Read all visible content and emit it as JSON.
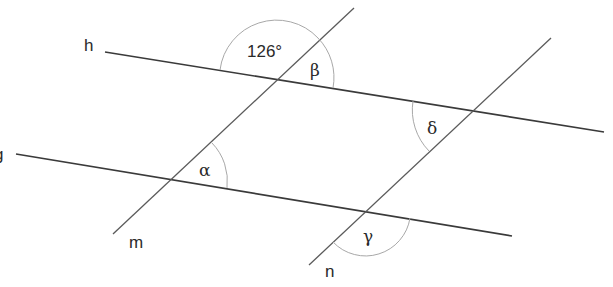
{
  "diagram": {
    "lines": [
      {
        "id": "h",
        "label": "h",
        "type": "parallel"
      },
      {
        "id": "g",
        "label": "g",
        "type": "parallel"
      },
      {
        "id": "m",
        "label": "m",
        "type": "transversal"
      },
      {
        "id": "n",
        "label": "n",
        "type": "transversal"
      }
    ],
    "angles": {
      "given": {
        "label": "126°",
        "at": "h ∩ m"
      },
      "beta": {
        "label": "β",
        "at": "h ∩ m"
      },
      "alpha": {
        "label": "α",
        "at": "g ∩ m"
      },
      "delta": {
        "label": "δ",
        "at": "h ∩ n"
      },
      "gamma": {
        "label": "γ",
        "at": "g ∩ n"
      }
    }
  }
}
